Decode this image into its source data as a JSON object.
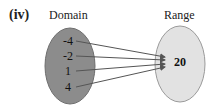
{
  "part_label": "(iv)",
  "domain": {
    "title": "Domain",
    "values": [
      "-4",
      "-2",
      "1",
      "4"
    ],
    "color": "#8c8c8c"
  },
  "range": {
    "title": "Range",
    "values": [
      "20"
    ],
    "color": "#e2e2e2"
  },
  "mapping": [
    {
      "from": "-4",
      "to": "20"
    },
    {
      "from": "-2",
      "to": "20"
    },
    {
      "from": "1",
      "to": "20"
    },
    {
      "from": "4",
      "to": "20"
    }
  ]
}
